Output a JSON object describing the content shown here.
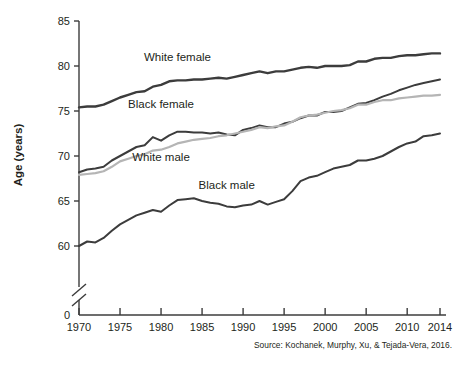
{
  "figure": {
    "source_note": "Source: Kochanek, Murphy, Xu, & Tejada-Vera, 2016.",
    "background_color": "#ffffff",
    "axis_color": "#3c3c3c"
  },
  "chart_data": {
    "type": "line",
    "title": "",
    "subtitle": "",
    "xlabel": "",
    "ylabel": "Age (years)",
    "xlim": [
      1970,
      2014
    ],
    "ylim": [
      58.8,
      85
    ],
    "grid": false,
    "legend_position": "inline-labels",
    "y_axis_break": true,
    "y_axis_break_note": "Axis broken between 0 and ~59",
    "yticks": [
      0,
      60,
      65,
      70,
      75,
      80,
      85
    ],
    "ytick_labels": [
      "0",
      "60",
      "65",
      "70",
      "75",
      "80",
      "85"
    ],
    "xticks": [
      1970,
      1975,
      1980,
      1985,
      1990,
      1995,
      2000,
      2005,
      2010,
      2014
    ],
    "xtick_labels": [
      "1970",
      "1975",
      "1980",
      "1985",
      "1990",
      "1995",
      "2000",
      "2005",
      "2010",
      "2014"
    ],
    "x": [
      1970,
      1971,
      1972,
      1973,
      1974,
      1975,
      1976,
      1977,
      1978,
      1979,
      1980,
      1981,
      1982,
      1983,
      1984,
      1985,
      1986,
      1987,
      1988,
      1989,
      1990,
      1991,
      1992,
      1993,
      1994,
      1995,
      1996,
      1997,
      1998,
      1999,
      2000,
      2001,
      2002,
      2003,
      2004,
      2005,
      2006,
      2007,
      2008,
      2009,
      2010,
      2011,
      2012,
      2013,
      2014
    ],
    "series": [
      {
        "name": "White female",
        "color": "#3c3c3c",
        "line_width": 2.4,
        "label_x": 1982,
        "label_y": 80.6,
        "values": [
          75.4,
          75.5,
          75.5,
          75.7,
          76.1,
          76.5,
          76.8,
          77.1,
          77.2,
          77.7,
          77.9,
          78.3,
          78.4,
          78.4,
          78.5,
          78.5,
          78.6,
          78.7,
          78.6,
          78.8,
          79.0,
          79.2,
          79.4,
          79.2,
          79.4,
          79.4,
          79.6,
          79.8,
          79.9,
          79.8,
          80.0,
          80.0,
          80.0,
          80.1,
          80.5,
          80.5,
          80.8,
          80.9,
          80.9,
          81.1,
          81.2,
          81.2,
          81.3,
          81.4,
          81.4
        ]
      },
      {
        "name": "Black female",
        "color": "#3c3c3c",
        "line_width": 2.0,
        "label_x": 1980,
        "label_y": 75.3,
        "values": [
          68.2,
          68.5,
          68.6,
          68.8,
          69.5,
          70.0,
          70.5,
          71.0,
          71.2,
          72.1,
          71.7,
          72.3,
          72.7,
          72.7,
          72.6,
          72.6,
          72.5,
          72.6,
          72.4,
          72.3,
          72.9,
          73.1,
          73.4,
          73.2,
          73.2,
          73.6,
          73.8,
          74.2,
          74.5,
          74.5,
          74.9,
          74.9,
          75.0,
          75.4,
          75.8,
          75.9,
          76.2,
          76.6,
          76.9,
          77.3,
          77.6,
          77.9,
          78.1,
          78.3,
          78.5
        ]
      },
      {
        "name": "White male",
        "color": "#b5b5b5",
        "line_width": 2.2,
        "label_x": 1980,
        "label_y": 69.4,
        "values": [
          67.9,
          68.0,
          68.1,
          68.3,
          68.8,
          69.4,
          69.7,
          70.0,
          70.2,
          70.6,
          70.7,
          71.0,
          71.4,
          71.6,
          71.8,
          71.9,
          72.0,
          72.2,
          72.3,
          72.5,
          72.7,
          72.9,
          73.2,
          73.1,
          73.3,
          73.4,
          73.8,
          74.3,
          74.5,
          74.6,
          74.8,
          75.0,
          75.1,
          75.3,
          75.7,
          75.7,
          76.0,
          76.2,
          76.2,
          76.4,
          76.5,
          76.6,
          76.7,
          76.7,
          76.8
        ]
      },
      {
        "name": "Black male",
        "color": "#3c3c3c",
        "line_width": 2.0,
        "label_x": 1988,
        "label_y": 66.3,
        "values": [
          60.0,
          60.5,
          60.4,
          60.9,
          61.7,
          62.4,
          62.9,
          63.4,
          63.7,
          64.0,
          63.8,
          64.5,
          65.1,
          65.2,
          65.3,
          65.0,
          64.8,
          64.7,
          64.4,
          64.3,
          64.5,
          64.6,
          65.0,
          64.6,
          64.9,
          65.2,
          66.1,
          67.2,
          67.6,
          67.8,
          68.2,
          68.6,
          68.8,
          69.0,
          69.5,
          69.5,
          69.7,
          70.0,
          70.5,
          71.0,
          71.4,
          71.6,
          72.2,
          72.3,
          72.5
        ]
      }
    ]
  }
}
